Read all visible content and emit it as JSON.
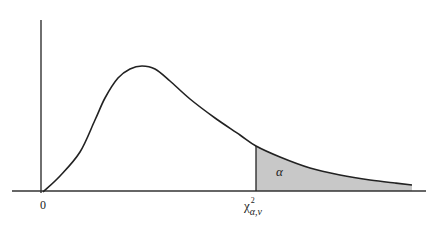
{
  "figure": {
    "type": "chi-square distribution density curve",
    "labels": {
      "origin": "0",
      "tail_area": "α",
      "critical_value_base": "χ",
      "critical_value_superscript": "2",
      "critical_value_subscript": "α,ν"
    },
    "colors": {
      "stroke": "#222222",
      "shaded_region": "#c8c8c8",
      "top_rule": "#555555"
    },
    "geometry": {
      "y_axis": {
        "x": 41,
        "y_top": 20,
        "y_bottom": 193
      },
      "x_axis": {
        "y": 191,
        "x_left": 12,
        "x_right": 426
      },
      "curve_points": [
        [
          43,
          192
        ],
        [
          60,
          176
        ],
        [
          80,
          152
        ],
        [
          95,
          120
        ],
        [
          105,
          98
        ],
        [
          118,
          78
        ],
        [
          130,
          69
        ],
        [
          142,
          66
        ],
        [
          155,
          69
        ],
        [
          170,
          81
        ],
        [
          190,
          99
        ],
        [
          215,
          118
        ],
        [
          240,
          135
        ],
        [
          256,
          146
        ],
        [
          280,
          157
        ],
        [
          310,
          168
        ],
        [
          340,
          175
        ],
        [
          370,
          180
        ],
        [
          395,
          183
        ],
        [
          412,
          185
        ]
      ],
      "critical_line_x": 256,
      "peak": [
        142,
        66
      ]
    }
  }
}
